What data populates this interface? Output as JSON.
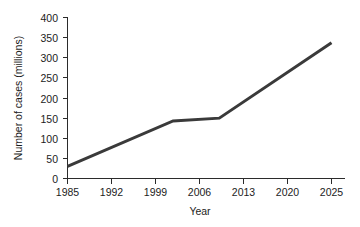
{
  "chart_data": {
    "type": "line",
    "title": "",
    "xlabel": "Year",
    "ylabel": "Number of cases (millions)",
    "xlim": [
      1985,
      2025
    ],
    "ylim": [
      0,
      400
    ],
    "grid": false,
    "legend": "none",
    "x_ticks": [
      "1985",
      "1992",
      "1999",
      "2006",
      "2013",
      "2020",
      "2025"
    ],
    "x_tick_values": [
      1985,
      1992,
      1999,
      2006,
      2013,
      2020,
      2025
    ],
    "y_ticks": [
      "0",
      "50",
      "100",
      "150",
      "200",
      "250",
      "300",
      "350",
      "400"
    ],
    "y_tick_values": [
      0,
      50,
      100,
      150,
      200,
      250,
      300,
      350,
      400
    ],
    "series": [
      {
        "name": "Number of cases",
        "color": "#3a3a3a",
        "x": [
          1985,
          2001,
          2008,
          2025
        ],
        "values": [
          30,
          143,
          150,
          337
        ],
        "points": [
          {
            "x": 1985,
            "y": 30
          },
          {
            "x": 2001,
            "y": 143
          },
          {
            "x": 2008,
            "y": 150
          },
          {
            "x": 2025,
            "y": 337
          }
        ]
      }
    ]
  },
  "axes": {
    "x_axis_label": "Year",
    "y_axis_label": "Number of cases (millions)"
  }
}
